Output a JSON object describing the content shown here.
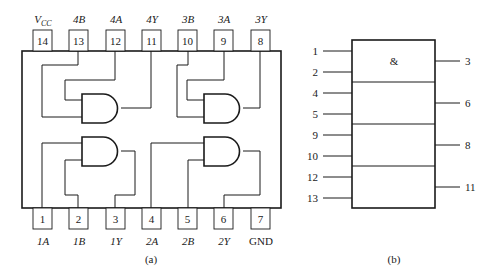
{
  "figure_a": {
    "caption": "(a)",
    "top_pins": [
      {
        "num": "14",
        "label": "VCC",
        "label_main": "V",
        "label_sub": "CC"
      },
      {
        "num": "13",
        "label": "4B"
      },
      {
        "num": "12",
        "label": "4A"
      },
      {
        "num": "11",
        "label": "4Y"
      },
      {
        "num": "10",
        "label": "3B"
      },
      {
        "num": "9",
        "label": "3A"
      },
      {
        "num": "8",
        "label": "3Y"
      }
    ],
    "bottom_pins": [
      {
        "num": "1",
        "label": "1A"
      },
      {
        "num": "2",
        "label": "1B"
      },
      {
        "num": "3",
        "label": "1Y"
      },
      {
        "num": "4",
        "label": "2A"
      },
      {
        "num": "5",
        "label": "2B"
      },
      {
        "num": "6",
        "label": "2Y"
      },
      {
        "num": "7",
        "label": "GND"
      }
    ],
    "gates": [
      "gate-4",
      "gate-3",
      "gate-1",
      "gate-2"
    ]
  },
  "figure_b": {
    "caption": "(b)",
    "symbol": "&",
    "inputs": [
      "1",
      "2",
      "4",
      "5",
      "9",
      "10",
      "12",
      "13"
    ],
    "outputs": [
      "3",
      "6",
      "8",
      "11"
    ]
  }
}
